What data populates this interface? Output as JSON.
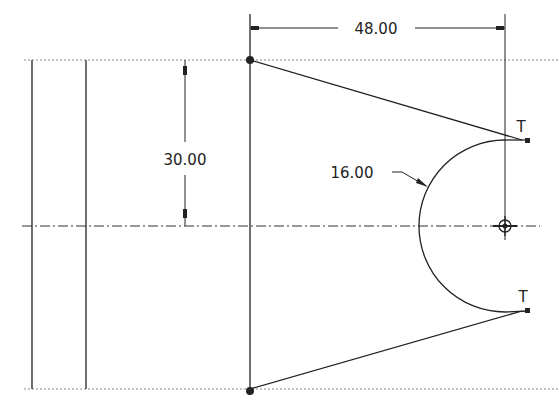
{
  "drawing": {
    "dimensions": {
      "horizontal": {
        "label": "48.00"
      },
      "vertical": {
        "label": "30.00"
      },
      "radius": {
        "label": "16.00"
      }
    },
    "tangent_markers": [
      {
        "label": "T"
      },
      {
        "label": "T"
      }
    ],
    "colors": {
      "line": "#222222",
      "background": "#ffffff",
      "reference": "#888888"
    }
  }
}
